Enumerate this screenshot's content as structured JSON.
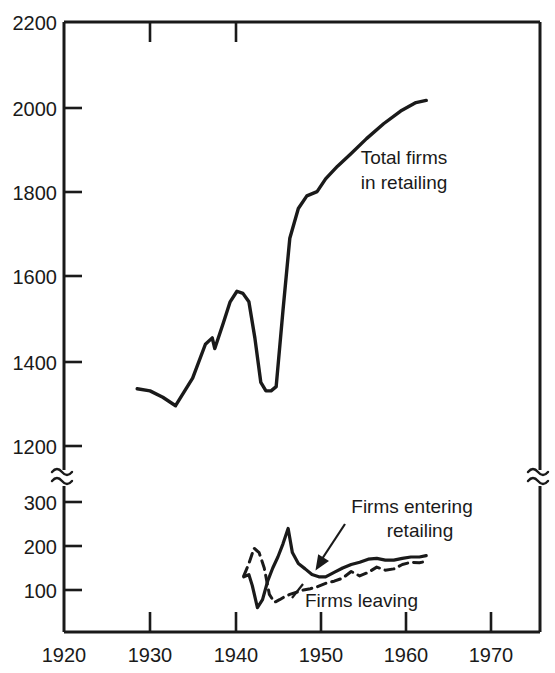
{
  "chart_data": {
    "type": "line",
    "title": "",
    "xlabel": "",
    "ylabel": "",
    "xlim": [
      1920,
      1974
    ],
    "grid": false,
    "legend_position": "inline-annotations",
    "axis_break": {
      "present": true,
      "symbol": "≈",
      "note": "Y axis is broken between 1200 and 300; upper panel 1200-2200, lower panel 0-300"
    },
    "y_axis_upper": {
      "ticks": [
        1200,
        1400,
        1600,
        1800,
        2000,
        2200
      ],
      "tick_labels": [
        "1200",
        "1400",
        "1600",
        "1800",
        "2000",
        "2200"
      ],
      "range": [
        1200,
        2200
      ]
    },
    "y_axis_lower": {
      "ticks": [
        100,
        200,
        300
      ],
      "tick_labels": [
        "100",
        "200",
        "300"
      ],
      "range": [
        0,
        300
      ]
    },
    "x_ticks": [
      1920,
      1930,
      1940,
      1950,
      1960,
      1970
    ],
    "x_tick_labels": [
      "1920",
      "1930",
      "1940",
      "1950",
      "1960",
      "1970"
    ],
    "series": [
      {
        "name": "Total firms in retailing",
        "panel": "upper",
        "style": "solid",
        "label_text_line1": "Total firms",
        "label_text_line2": "in retailing",
        "x": [
          1928.5,
          1930.0,
          1931.5,
          1933.0,
          1935.0,
          1936.5,
          1937.3,
          1937.6,
          1938.6,
          1939.4,
          1940.2,
          1940.9,
          1941.6,
          1942.3,
          1943.0,
          1943.6,
          1944.2,
          1944.8,
          1945.6,
          1946.4,
          1947.4,
          1948.4,
          1949.6,
          1950.6,
          1952.0,
          1953.6,
          1955.4,
          1957.4,
          1959.4,
          1961.2,
          1962.4
        ],
        "y": [
          1335,
          1330,
          1315,
          1295,
          1360,
          1440,
          1455,
          1430,
          1490,
          1540,
          1565,
          1560,
          1540,
          1455,
          1350,
          1330,
          1330,
          1340,
          1520,
          1690,
          1760,
          1790,
          1800,
          1830,
          1860,
          1890,
          1925,
          1960,
          1990,
          2010,
          2015
        ]
      },
      {
        "name": "Firms entering retailing",
        "panel": "lower",
        "style": "solid",
        "label_text_line1": "Firms entering",
        "label_text_line2": "retailing",
        "x": [
          1941.0,
          1941.6,
          1942.0,
          1942.6,
          1943.2,
          1943.8,
          1944.4,
          1945.0,
          1945.6,
          1946.2,
          1946.7,
          1947.4,
          1948.2,
          1949.0,
          1949.8,
          1950.6,
          1951.6,
          1952.6,
          1953.6,
          1954.6,
          1955.6,
          1956.6,
          1957.6,
          1958.6,
          1959.6,
          1960.6,
          1961.6,
          1962.4
        ],
        "y": [
          130,
          135,
          110,
          60,
          78,
          120,
          150,
          175,
          205,
          240,
          185,
          160,
          148,
          135,
          130,
          130,
          140,
          150,
          158,
          163,
          170,
          172,
          168,
          168,
          172,
          175,
          175,
          178
        ]
      },
      {
        "name": "Firms leaving",
        "panel": "lower",
        "style": "dashed",
        "label_text": "Firms leaving",
        "x": [
          1941.0,
          1941.6,
          1942.2,
          1942.8,
          1943.4,
          1944.0,
          1944.6,
          1945.2,
          1945.8,
          1946.4,
          1947.2,
          1948.0,
          1948.8,
          1949.6,
          1950.6,
          1951.6,
          1952.6,
          1953.6,
          1954.6,
          1955.6,
          1956.6,
          1957.6,
          1958.6,
          1959.6,
          1960.6,
          1961.6,
          1962.4
        ],
        "y": [
          132,
          160,
          195,
          185,
          150,
          90,
          72,
          78,
          85,
          90,
          95,
          100,
          103,
          107,
          115,
          120,
          127,
          142,
          132,
          140,
          152,
          145,
          148,
          158,
          163,
          162,
          165
        ]
      }
    ]
  },
  "annotations": {
    "total_firms": {
      "line1": "Total firms",
      "line2": "in retailing"
    },
    "firms_entering": {
      "line1": "Firms entering",
      "line2": "retailing"
    },
    "firms_leaving": {
      "text": "Firms leaving"
    }
  },
  "colors": {
    "axis": "#1a1a1a",
    "line": "#1a1a1a",
    "background": "#ffffff"
  }
}
